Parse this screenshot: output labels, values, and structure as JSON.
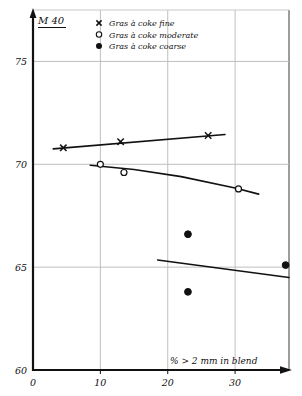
{
  "corner": {
    "label": "M 40"
  },
  "legend": {
    "items": [
      {
        "marker": "cross-marker",
        "label": "Gras à coke fine"
      },
      {
        "marker": "open-circle-marker",
        "label": "Gras à coke moderate"
      },
      {
        "marker": "filled-circle-marker",
        "label": "Gras à coke coarse"
      }
    ]
  },
  "axes": {
    "x_label": "% > 2 mm in blend",
    "y_label": "M 40",
    "x_ticks": [
      "0",
      "10",
      "20",
      "30"
    ],
    "y_ticks": [
      "60",
      "65",
      "70",
      "75"
    ]
  },
  "chart_data": {
    "type": "scatter",
    "title": "M 40",
    "xlabel": "% > 2 mm in blend",
    "ylabel": "M 40",
    "xlim": [
      0,
      38
    ],
    "ylim": [
      60,
      77.5
    ],
    "xticks": [
      0,
      10,
      20,
      30
    ],
    "yticks": [
      60,
      65,
      70,
      75
    ],
    "grid": true,
    "legend_position": "top-center",
    "series": [
      {
        "name": "Gras à coke fine",
        "marker": "x",
        "points": [
          {
            "x": 4.5,
            "y": 70.8
          },
          {
            "x": 13.0,
            "y": 71.1
          },
          {
            "x": 26.0,
            "y": 71.4
          }
        ],
        "fit_line": [
          {
            "x": 3.0,
            "y": 70.75
          },
          {
            "x": 28.5,
            "y": 71.45
          }
        ]
      },
      {
        "name": "Gras à coke moderate",
        "marker": "o",
        "points": [
          {
            "x": 10.0,
            "y": 70.0
          },
          {
            "x": 13.5,
            "y": 69.6
          },
          {
            "x": 30.5,
            "y": 68.8
          }
        ],
        "fit_line": [
          {
            "x": 8.5,
            "y": 69.95
          },
          {
            "x": 15.0,
            "y": 69.75
          },
          {
            "x": 22.0,
            "y": 69.4
          },
          {
            "x": 30.0,
            "y": 68.85
          },
          {
            "x": 33.5,
            "y": 68.55
          }
        ]
      },
      {
        "name": "Gras à coke coarse",
        "marker": "●",
        "points": [
          {
            "x": 23.0,
            "y": 66.6
          },
          {
            "x": 23.0,
            "y": 63.8
          },
          {
            "x": 37.5,
            "y": 65.1
          }
        ],
        "fit_line": [
          {
            "x": 18.5,
            "y": 65.35
          },
          {
            "x": 38.0,
            "y": 64.5
          }
        ]
      }
    ]
  }
}
